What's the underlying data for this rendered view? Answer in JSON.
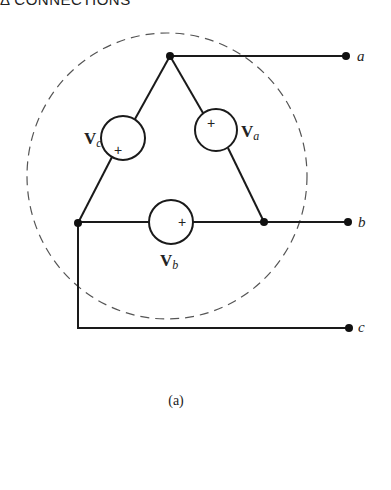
{
  "header": {
    "title": "Δ CONNECTIONS"
  },
  "diagram": {
    "caption": "(a)",
    "sources": [
      {
        "id": "Va",
        "symbol": "V",
        "subscript": "a",
        "polarity": "+"
      },
      {
        "id": "Vb",
        "symbol": "V",
        "subscript": "b",
        "polarity": "+"
      },
      {
        "id": "Vc",
        "symbol": "V",
        "subscript": "c",
        "polarity": "+"
      }
    ],
    "terminals": [
      {
        "label": "a"
      },
      {
        "label": "b"
      },
      {
        "label": "c"
      }
    ],
    "enclosure": "dashed-circle",
    "colors": {
      "line": "#1a1a1a",
      "dashed": "#555555"
    }
  }
}
